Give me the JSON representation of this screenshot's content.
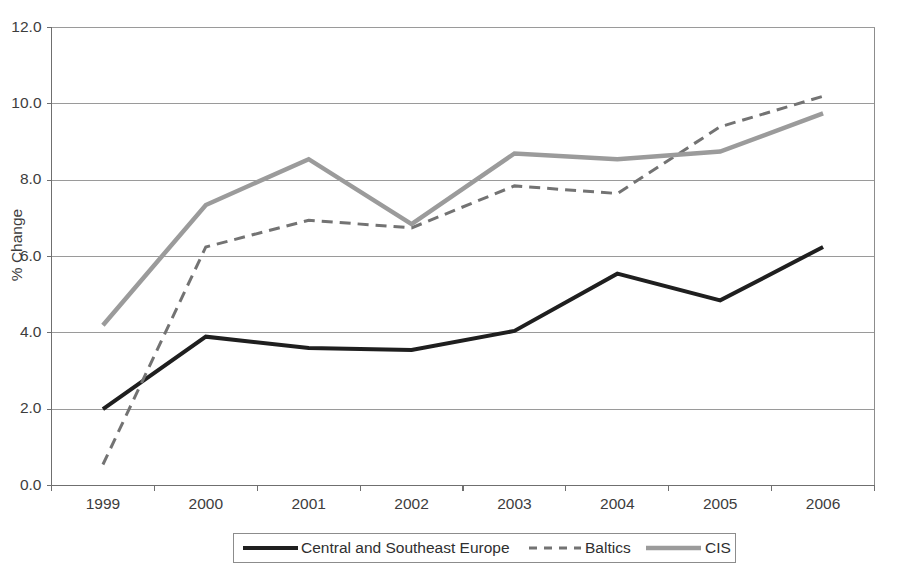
{
  "chart_data": {
    "type": "line",
    "title": "",
    "subtitle": "",
    "xlabel": "",
    "ylabel": "% Change",
    "x": [
      "1999",
      "2000",
      "2001",
      "2002",
      "2003",
      "2004",
      "2005",
      "2006"
    ],
    "categories": [
      "1999",
      "2000",
      "2001",
      "2002",
      "2003",
      "2004",
      "2005",
      "2006"
    ],
    "ylim": [
      0.0,
      12.0
    ],
    "ytick_labels": [
      "0.0",
      "2.0",
      "4.0",
      "6.0",
      "8.0",
      "10.0",
      "12.0"
    ],
    "ytick_values": [
      0.0,
      2.0,
      4.0,
      6.0,
      8.0,
      10.0,
      12.0
    ],
    "grid": "horizontal",
    "legend_position": "bottom",
    "series": [
      {
        "name": "Central and Southeast Europe",
        "values": [
          2.0,
          3.9,
          3.6,
          3.55,
          4.05,
          5.55,
          4.85,
          6.25
        ],
        "color": "#1f1f1f",
        "style": "solid",
        "width": 4.0
      },
      {
        "name": "Baltics",
        "values": [
          0.55,
          6.25,
          6.95,
          6.75,
          7.85,
          7.65,
          9.4,
          10.2
        ],
        "color": "#737373",
        "style": "dashed",
        "width": 3.0
      },
      {
        "name": "CIS",
        "values": [
          4.2,
          7.35,
          8.55,
          6.85,
          8.7,
          8.55,
          8.75,
          9.75
        ],
        "color": "#9b9b9b",
        "style": "solid",
        "width": 4.5
      }
    ]
  },
  "legend": {
    "items": [
      {
        "label": "Central and Southeast Europe"
      },
      {
        "label": "Baltics"
      },
      {
        "label": "CIS"
      }
    ]
  },
  "colors": {
    "series_central": "#1f1f1f",
    "series_baltics": "#737373",
    "series_cis": "#9b9b9b",
    "gridline": "#9a9a9a",
    "axis": "#6f6f6f",
    "plot_border": "#8c8c8c",
    "background": "#ffffff"
  }
}
